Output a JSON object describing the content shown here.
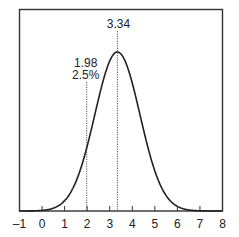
{
  "chart_data": {
    "type": "line",
    "title": "",
    "xlabel": "",
    "ylabel": "",
    "xlim": [
      -1,
      8
    ],
    "x_ticks": [
      -1,
      0,
      1,
      2,
      3,
      4,
      5,
      6,
      7,
      8
    ],
    "x_tick_labels": [
      "–1",
      "0",
      "1",
      "2",
      "3",
      "4",
      "5",
      "6",
      "7",
      "8"
    ],
    "grid": false,
    "legend": null,
    "series": [
      {
        "name": "normal density curve",
        "distribution": "normal",
        "mean": 3.34,
        "sd_approx": 1.0
      }
    ],
    "annotations": [
      {
        "x": 3.34,
        "label": "3.34",
        "style": "dotted vertical line",
        "meaning": "mean / peak"
      },
      {
        "x": 1.98,
        "label": "1.98",
        "sublabel": "2.5%",
        "style": "dotted vertical line",
        "meaning": "lower 2.5% point"
      }
    ],
    "colors": {
      "curve": "#222222",
      "axis": "#333333",
      "dotted": "#555555"
    }
  }
}
